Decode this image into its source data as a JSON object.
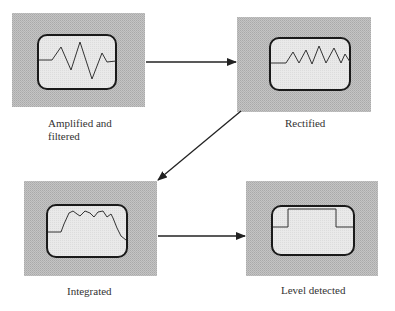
{
  "diagram": {
    "colors": {
      "panel_fill": "#bdbdbd",
      "screen_fill": "#e6e6e6",
      "screen_border": "#1a1a1a",
      "trace": "#333333",
      "arrow": "#222222"
    },
    "stages": [
      {
        "id": "amplified",
        "label_line1": "Amplified and",
        "label_line2": "filtered"
      },
      {
        "id": "rectified",
        "label": "Rectified"
      },
      {
        "id": "integrated",
        "label": "Integrated"
      },
      {
        "id": "level",
        "label": "Level detected"
      }
    ],
    "connections": [
      {
        "from": "amplified",
        "to": "rectified"
      },
      {
        "from": "rectified",
        "to": "integrated"
      },
      {
        "from": "integrated",
        "to": "level"
      }
    ]
  }
}
